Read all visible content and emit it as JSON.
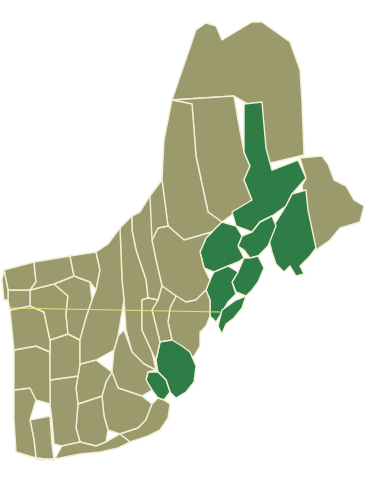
{
  "map": {
    "type": "choropleth",
    "region": "Northern New England (Vermont, New Hampshire, Maine) counties",
    "colors": {
      "base": "#9b9a6c",
      "highlight": "#2f7d46",
      "border": "#f2eed6",
      "line": "#e8e27a",
      "background": "#ffffff"
    },
    "legend": [],
    "highlighted_counties_count": 10,
    "counties": [
      {
        "id": "aroostook",
        "fill": "base",
        "d": "M172,100 L196,30 L206,23 L216,26 L222,40 L252,22 L262,22 L290,42 L300,70 L302,102 L304,155 L262,165 L262,148 L248,104 L234,96 L172,100 Z"
      },
      {
        "id": "piscataquis",
        "fill": "base",
        "d": "M172,100 L234,96 L238,120 L244,152 L250,166 L244,180 L252,200 L222,222 L208,212 L196,156 L192,104 Z"
      },
      {
        "id": "somerset",
        "fill": "base",
        "d": "M172,100 L192,104 L196,156 L208,212 L222,222 L212,232 L184,240 L168,226 L162,180 L164,140 L168,120 Z"
      },
      {
        "id": "penobscot",
        "fill": "highlight",
        "d": "M244,104 L262,102 L266,148 L272,170 L298,160 L306,178 L292,194 L286,206 L272,216 L260,222 L252,232 L236,226 L232,212 L252,200 L244,180 L250,166 L244,152 Z"
      },
      {
        "id": "washington",
        "fill": "base",
        "d": "M300,158 L322,156 L328,164 L334,180 L346,186 L354,200 L364,206 L360,222 L340,228 L330,240 L316,250 L310,228 L306,208 L302,186 L306,178 Z"
      },
      {
        "id": "hancock",
        "fill": "highlight",
        "d": "M292,194 L306,190 L308,210 L316,248 L310,256 L300,266 L304,274 L296,276 L290,266 L284,272 L276,264 L272,252 L268,236 L276,222 L286,206 Z"
      },
      {
        "id": "waldo",
        "fill": "highlight",
        "d": "M260,222 L272,216 L276,226 L272,236 L268,246 L258,256 L250,258 L244,250 L238,246 L242,236 L252,232 Z"
      },
      {
        "id": "kennebec",
        "fill": "highlight",
        "d": "M222,222 L236,226 L242,236 L238,246 L244,258 L238,262 L228,266 L222,278 L214,272 L204,268 L200,252 L206,238 L212,232 Z"
      },
      {
        "id": "knox-lincoln",
        "fill": "highlight",
        "d": "M244,258 L250,258 L258,256 L264,268 L258,282 L252,290 L246,296 L236,292 L232,282 L238,272 Z"
      },
      {
        "id": "sagadahoc-androscoggin",
        "fill": "highlight",
        "d": "M214,272 L228,266 L238,272 L232,282 L236,294 L228,302 L222,312 L216,322 L210,316 L210,300 L206,290 L210,280 Z"
      },
      {
        "id": "cumberland",
        "fill": "highlight",
        "d": "M222,310 L236,300 L246,296 L242,308 L234,318 L226,324 L222,334 L218,326 Z"
      },
      {
        "id": "oxford",
        "fill": "base",
        "d": "M168,226 L184,240 L212,232 L206,238 L200,252 L204,268 L210,280 L206,290 L196,300 L186,302 L176,296 L162,286 L156,260 L152,240 L158,228 Z"
      },
      {
        "id": "franklin-me",
        "fill": "base",
        "d": "M150,196 L162,180 L168,226 L158,228 L152,240 L144,232 L140,212 Z"
      },
      {
        "id": "york",
        "fill": "base",
        "d": "M176,296 L186,302 L196,300 L206,290 L210,300 L210,316 L206,326 L200,332 L200,346 L194,356 L184,360 L178,352 L172,340 L168,322 L170,308 Z"
      },
      {
        "id": "coos",
        "fill": "base",
        "d": "M140,212 L150,196 L152,240 L156,260 L162,286 L158,300 L148,298 L146,280 L136,250 L132,230 L132,216 Z"
      },
      {
        "id": "grafton",
        "fill": "base",
        "d": "M120,228 L132,216 L132,230 L136,250 L146,280 L148,298 L142,300 L142,330 L152,352 L156,370 L144,364 L132,352 L126,330 L124,300 L122,280 Z"
      },
      {
        "id": "carroll",
        "fill": "base",
        "d": "M158,300 L162,286 L176,296 L170,308 L168,322 L172,340 L160,342 L156,326 L152,310 Z"
      },
      {
        "id": "strafford",
        "fill": "highlight",
        "d": "M160,342 L172,340 L182,346 L190,352 L196,366 L194,382 L186,392 L176,398 L170,392 L166,380 L158,372 L156,360 Z"
      },
      {
        "id": "rockingham",
        "fill": "highlight",
        "d": "M148,372 L158,372 L166,380 L170,392 L164,400 L158,398 L152,390 L146,380 Z"
      },
      {
        "id": "belknap-merrimack",
        "fill": "base",
        "d": "M124,330 L132,352 L144,364 L156,370 L148,372 L146,380 L152,390 L142,396 L130,392 L118,388 L112,372 L114,350 L118,336 Z"
      },
      {
        "id": "hillsborough",
        "fill": "base",
        "d": "M112,372 L118,388 L130,392 L142,396 L152,404 L146,420 L138,428 L120,434 L108,430 L104,416 L102,396 L106,382 Z"
      },
      {
        "id": "cheshire",
        "fill": "base",
        "d": "M78,404 L102,396 L104,416 L108,430 L106,442 L96,446 L80,442 L76,428 Z"
      },
      {
        "id": "sullivan",
        "fill": "base",
        "d": "M80,364 L96,360 L112,372 L106,382 L102,396 L78,404 L76,388 L78,376 Z"
      },
      {
        "id": "windham",
        "fill": "base",
        "d": "M30,420 L50,416 L52,444 L54,460 L36,458 L34,440 Z"
      },
      {
        "id": "bennington",
        "fill": "base",
        "d": "M14,390 L30,388 L36,400 L30,420 L34,440 L36,458 L16,452 L14,420 Z"
      },
      {
        "id": "windsor",
        "fill": "base",
        "d": "M50,380 L78,376 L76,388 L78,404 L76,428 L80,442 L62,446 L54,444 L52,420 L50,404 Z"
      },
      {
        "id": "rutland",
        "fill": "base",
        "d": "M14,350 L36,346 L50,352 L50,380 L50,404 L36,400 L30,388 L14,390 Z"
      },
      {
        "id": "orange",
        "fill": "base",
        "d": "M50,340 L68,334 L80,340 L80,364 L78,376 L50,380 L50,352 Z"
      },
      {
        "id": "addison",
        "fill": "base",
        "d": "M10,310 L30,306 L44,312 L50,340 L50,352 L36,346 L14,350 L12,330 Z"
      },
      {
        "id": "washington-vt",
        "fill": "base",
        "d": "M30,290 L54,284 L68,296 L66,314 L68,334 L50,340 L44,312 L30,306 Z"
      },
      {
        "id": "chittenden",
        "fill": "base",
        "d": "M8,290 L30,290 L30,306 L10,310 L8,300 Z"
      },
      {
        "id": "lamoille-caledonia",
        "fill": "base",
        "d": "M54,284 L74,276 L90,282 L92,300 L86,318 L80,340 L68,334 L66,314 L68,296 Z"
      },
      {
        "id": "franklin-vt",
        "fill": "base",
        "d": "M4,270 L34,262 L36,282 L30,290 L8,290 Z"
      },
      {
        "id": "orleans",
        "fill": "base",
        "d": "M34,262 L70,256 L74,276 L54,284 L30,290 L36,282 Z"
      },
      {
        "id": "essex-vt",
        "fill": "base",
        "d": "M70,256 L96,252 L100,270 L96,290 L90,282 L74,276 Z"
      },
      {
        "id": "grand-isle",
        "fill": "base",
        "d": "M4,270 L8,290 L8,300 L4,300 L2,280 Z"
      },
      {
        "id": "nh-north-strip",
        "fill": "base",
        "d": "M96,252 L108,244 L120,228 L122,280 L124,300 L118,336 L114,350 L96,360 L80,364 L80,340 L86,318 L92,300 L96,290 L100,270 Z"
      },
      {
        "id": "east-upper",
        "fill": "base",
        "d": "M142,300 L148,298 L158,300 L152,310 L156,326 L160,342 L156,360 L152,352 L142,330 Z"
      },
      {
        "id": "hampden-area",
        "fill": "base",
        "d": "M120,434 L138,428 L146,420 L152,404 L158,398 L164,400 L170,404 L168,418 L160,430 L148,436 L130,442 Z"
      },
      {
        "id": "south-row",
        "fill": "base",
        "d": "M36,458 L54,460 L62,446 L80,442 L96,446 L106,442 L120,434 L130,442 L118,448 L100,452 L80,454 L60,458 L40,460 Z"
      }
    ],
    "state_line": {
      "x1": 10,
      "y1": 308,
      "x2": 220,
      "y2": 312
    }
  }
}
